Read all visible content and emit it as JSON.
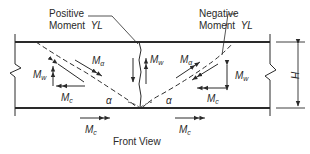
{
  "labels": {
    "positive_line1": "Positive",
    "positive_line2": "Moment",
    "positive_yl": "YL",
    "negative_line1": "Negative",
    "negative_line2": "Moment",
    "negative_yl": "YL",
    "caption": "Front View",
    "height_dim": "H",
    "angle": "α",
    "moment_main": "M",
    "sub_w": "w",
    "sub_alpha": "α",
    "sub_c": "c"
  },
  "colors": {
    "ink": "#2a2a2a",
    "background": "#ffffff"
  }
}
